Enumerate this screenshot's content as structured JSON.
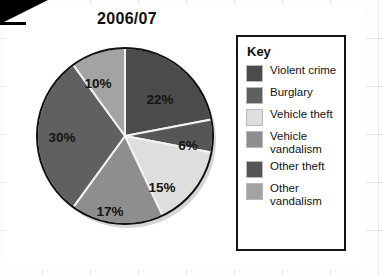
{
  "page": {
    "background": "#fdfdfd",
    "card_background": "#ffffff",
    "grid_color": "#d2d6de",
    "corner_fold_color": "#000000"
  },
  "title": "2006/07",
  "legend": {
    "heading": "Key",
    "border_color": "#141414",
    "items": [
      {
        "label": "Violent crime",
        "label_line1": "Violent crime",
        "label_line2": "",
        "color": "#4b4b4b"
      },
      {
        "label": "Burglary",
        "label_line1": "Burglary",
        "label_line2": "",
        "color": "#606060"
      },
      {
        "label": "Vehicle theft",
        "label_line1": "Vehicle theft",
        "label_line2": "",
        "color": "#dedede"
      },
      {
        "label": "Vehicle vandalism",
        "label_line1": "Vehicle",
        "label_line2": "vandalism",
        "color": "#8e8e8e"
      },
      {
        "label": "Other theft",
        "label_line1": "Other theft",
        "label_line2": "",
        "color": "#565656"
      },
      {
        "label": "Other vandalism",
        "label_line1": "Other",
        "label_line2": "vandalism",
        "color": "#a3a3a3"
      }
    ]
  },
  "chart_data": {
    "type": "pie",
    "title": "2006/07",
    "xlabel": "",
    "ylabel": "",
    "start_angle_deg": 0,
    "direction": "clockwise",
    "center": {
      "x": 95,
      "y": 94
    },
    "radius": 88,
    "outline_color": "#111111",
    "divider_color": "#f2f2f2",
    "categories": [
      "Violent crime",
      "Other theft",
      "Vehicle theft",
      "Vehicle vandalism",
      "Burglary",
      "Other vandalism"
    ],
    "values": [
      22,
      6,
      15,
      17,
      30,
      10
    ],
    "labels": [
      "22%",
      "6%",
      "15%",
      "17%",
      "30%",
      "10%"
    ],
    "colors": [
      "#4b4b4b",
      "#565656",
      "#dedede",
      "#8e8e8e",
      "#606060",
      "#a3a3a3"
    ],
    "slices": [
      {
        "name": "Violent crime",
        "value": 22,
        "label": "22%",
        "color": "#4b4b4b",
        "label_x": 130,
        "label_y": 62
      },
      {
        "name": "Other theft",
        "value": 6,
        "label": "6%",
        "color": "#565656",
        "label_x": 158,
        "label_y": 108
      },
      {
        "name": "Vehicle theft",
        "value": 15,
        "label": "15%",
        "color": "#dedede",
        "label_x": 132,
        "label_y": 150
      },
      {
        "name": "Vehicle vandalism",
        "value": 17,
        "label": "17%",
        "color": "#8e8e8e",
        "label_x": 80,
        "label_y": 174
      },
      {
        "name": "Burglary",
        "value": 30,
        "label": "30%",
        "color": "#606060",
        "label_x": 32,
        "label_y": 100
      },
      {
        "name": "Other vandalism",
        "value": 10,
        "label": "10%",
        "color": "#a3a3a3",
        "label_x": 68,
        "label_y": 46
      }
    ],
    "legend_position": "right",
    "grid": false
  }
}
